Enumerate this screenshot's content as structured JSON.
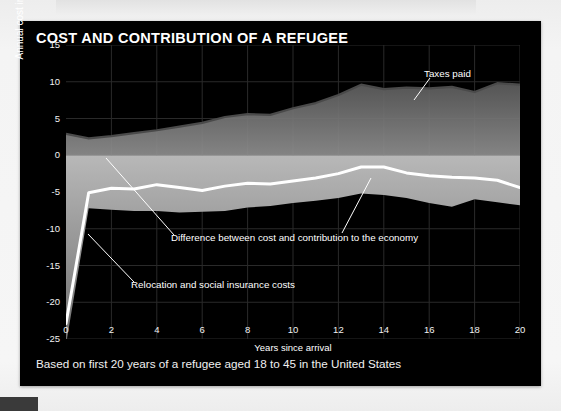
{
  "figure": {
    "title": "COST AND CONTRIBUTION OF A REFUGEE",
    "caption": "Based on first 20 years of a refugee aged 18 to 45 in the United States"
  },
  "colors": {
    "card_background": "#000000",
    "page_background": "#f2f2f2",
    "difference_line": "#ffffff",
    "taxes_line": "#3a3a3a",
    "cost_area": "#9a9a9a",
    "taxes_area": "#6e6e6e",
    "grid": "#2a2a2a",
    "text": "#ffffff"
  },
  "annotations": {
    "taxes_paid": "Taxes paid",
    "difference": "Difference between cost and contribution to the economy",
    "relocation": "Relocation and social insurance costs"
  },
  "chart_data": {
    "type": "area",
    "title": "COST AND CONTRIBUTION OF A REFUGEE",
    "subtitle": "Based on first 20 years of a refugee aged 18 to 45 in the United States",
    "xlabel": "Years since arrival",
    "ylabel": "Annual cost in U.S. dollars (thousands)",
    "xlim": [
      0,
      20
    ],
    "ylim": [
      -25,
      15
    ],
    "xticks": [
      0,
      2,
      4,
      6,
      8,
      10,
      12,
      14,
      16,
      18,
      20
    ],
    "yticks": [
      15,
      10,
      5,
      0,
      -5,
      -10,
      -15,
      -20,
      -25
    ],
    "grid": true,
    "legend": "annotations on plot",
    "x": [
      0,
      1,
      2,
      3,
      4,
      5,
      6,
      7,
      8,
      9,
      10,
      11,
      12,
      13,
      14,
      15,
      16,
      17,
      18,
      19,
      20
    ],
    "series": [
      {
        "name": "Taxes paid",
        "type": "line",
        "values": [
          2.9,
          2.3,
          2.6,
          3.0,
          3.4,
          3.9,
          4.4,
          5.2,
          5.6,
          5.5,
          6.4,
          7.1,
          8.2,
          9.6,
          9.0,
          9.2,
          9.1,
          9.3,
          8.6,
          9.8,
          9.6
        ]
      },
      {
        "name": "Relocation and social insurance costs",
        "type": "area",
        "values": [
          -25.8,
          -7.2,
          -7.4,
          -7.6,
          -7.6,
          -7.8,
          -7.7,
          -7.6,
          -7.1,
          -6.9,
          -6.5,
          -6.2,
          -5.8,
          -5.2,
          -5.4,
          -5.8,
          -6.5,
          -7.0,
          -6.0,
          -6.4,
          -6.8
        ]
      },
      {
        "name": "Difference between cost and contribution to the economy",
        "type": "line",
        "values": [
          -22.9,
          -5.1,
          -4.5,
          -4.6,
          -4.0,
          -4.4,
          -4.8,
          -4.2,
          -3.8,
          -3.9,
          -3.5,
          -3.1,
          -2.5,
          -1.6,
          -1.6,
          -2.4,
          -2.8,
          -3.0,
          -3.1,
          -3.4,
          -4.4
        ]
      }
    ]
  },
  "axis": {
    "y_labels": [
      "15",
      "10",
      "5",
      "0",
      "-5",
      "-10",
      "-15",
      "-20",
      "-25"
    ],
    "x_labels": [
      "0",
      "2",
      "4",
      "6",
      "8",
      "10",
      "12",
      "14",
      "16",
      "18",
      "20"
    ],
    "y_title": "Annual cost in U.S. dollars (thousands)",
    "x_title": "Years since arrival"
  }
}
